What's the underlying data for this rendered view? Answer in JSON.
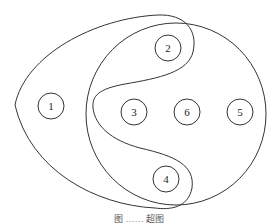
{
  "diagram": {
    "type": "hypergraph",
    "nodes": [
      {
        "id": "1",
        "label": "1",
        "cx": 51,
        "cy": 106
      },
      {
        "id": "2",
        "label": "2",
        "cx": 168,
        "cy": 48
      },
      {
        "id": "3",
        "label": "3",
        "cx": 134,
        "cy": 112
      },
      {
        "id": "6",
        "label": "6",
        "cx": 187,
        "cy": 112
      },
      {
        "id": "5",
        "label": "5",
        "cx": 240,
        "cy": 112
      },
      {
        "id": "4",
        "label": "4",
        "cx": 166,
        "cy": 179
      }
    ],
    "hyperedges": [
      {
        "name": "left-set",
        "members": [
          "1",
          "2",
          "4"
        ]
      },
      {
        "name": "right-set",
        "members": [
          "2",
          "3",
          "4",
          "5",
          "6"
        ]
      }
    ],
    "caption": "图 …… 超图"
  }
}
